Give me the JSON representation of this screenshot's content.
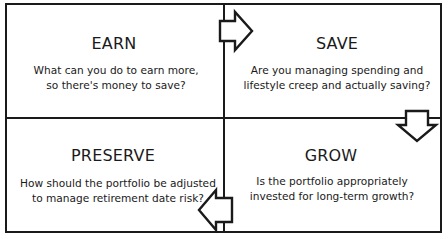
{
  "diagram": {
    "type": "quadrant-cycle",
    "stroke_color": "#1a1a1a",
    "background_color": "#ffffff",
    "quadrants": [
      {
        "id": "earn",
        "title": "EARN",
        "desc_line1": "What can you do to earn more,",
        "desc_line2": "so there's money to save?"
      },
      {
        "id": "save",
        "title": "SAVE",
        "desc_line1": "Are you managing spending and",
        "desc_line2": "lifestyle creep and actually saving?"
      },
      {
        "id": "preserve",
        "title": "PRESERVE",
        "desc_line1": "How should the portfolio be adjusted",
        "desc_line2": "to manage retirement date risk?"
      },
      {
        "id": "grow",
        "title": "GROW",
        "desc_line1": "Is the portfolio appropriately",
        "desc_line2": "invested for long-term growth?"
      }
    ],
    "arrows": [
      {
        "from": "earn",
        "to": "save",
        "direction": "right",
        "icon": "arrow-right-icon"
      },
      {
        "from": "save",
        "to": "grow",
        "direction": "down",
        "icon": "arrow-down-icon"
      },
      {
        "from": "grow",
        "to": "preserve",
        "direction": "left",
        "icon": "arrow-left-icon"
      }
    ]
  }
}
